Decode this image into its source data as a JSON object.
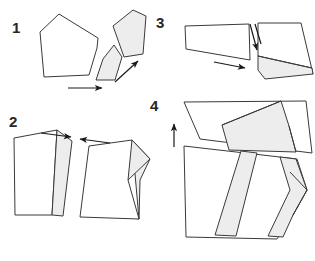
{
  "figure": {
    "width": 315,
    "height": 261,
    "background_color": "#ffffff",
    "outline_color": "#3a3a3a",
    "shaded_fill_color": "#ededed",
    "unshaded_fill_color": "#ffffff",
    "arrow_color": "#1a1a1a",
    "label_color": "#262626"
  },
  "panels": [
    {
      "id": "panel-1",
      "label": "1",
      "label_x": 12,
      "label_y": 33,
      "description": "Large unshaded pentagon at left with two shaded slivers split off to the right; horizontal arrow below and diagonal arrow pointing up-right",
      "shapes": [
        {
          "name": "main-pentagon",
          "shaded": false,
          "points": "59,14 98,38 97,48 89,75 44,77 40,32"
        },
        {
          "name": "shaded-sliver-lower",
          "shaded": true,
          "points": "114,45 122,57 115,80 96,80 103,59"
        },
        {
          "name": "shaded-sliver-upper",
          "shaded": true,
          "points": "133,10 146,16 143,54 124,57 113,26"
        }
      ],
      "arrows": [
        {
          "name": "arrow-right-bottom",
          "x1": 68,
          "y1": 88,
          "x2": 104,
          "y2": 88
        },
        {
          "name": "arrow-up-right",
          "x1": 115,
          "y1": 82,
          "x2": 140,
          "y2": 59
        }
      ]
    },
    {
      "id": "panel-2",
      "label": "2",
      "label_x": 9,
      "label_y": 127,
      "description": "Two polygons with shaded bands being pushed toward each other; arrow pointing right above the left shape and arrow pointing left above the right shape",
      "shapes": [
        {
          "name": "left-quad-unshaded",
          "shaded": false,
          "points": "14,138 57,130 52,215 15,215"
        },
        {
          "name": "left-band-shaded",
          "shaded": true,
          "points": "57,130 72,141 63,216 52,215"
        },
        {
          "name": "right-quad-unshaded",
          "shaded": false,
          "points": "89,146 132,140 139,219 80,217"
        },
        {
          "name": "right-band-shaded",
          "shaded": true,
          "points": "132,140 150,159 140,180 139,219 112,214 128,180"
        },
        {
          "name": "right-tip-shaded",
          "shaded": true,
          "points": "133,153 150,159 140,180"
        }
      ],
      "arrows": [
        {
          "name": "arrow-right-top-left-shape",
          "x1": 41,
          "y1": 133,
          "x2": 73,
          "y2": 137
        },
        {
          "name": "arrow-left-top-right-shape",
          "x1": 110,
          "y1": 143,
          "x2": 78,
          "y2": 139
        }
      ]
    },
    {
      "id": "panel-3",
      "label": "3",
      "label_x": 156,
      "label_y": 28,
      "description": "Left trapezoid separated from right trapezoid with a large shaded wedge; short double vertical arrow pointing down in the gap and a horizontal arrow pointing right below",
      "shapes": [
        {
          "name": "left-trapezoid",
          "shaded": false,
          "points": "185,26 249,24 250,60 186,49"
        },
        {
          "name": "right-trapezoid-unshaded",
          "shaded": false,
          "points": "258,23 301,23 312,68 258,56"
        },
        {
          "name": "right-wedge-shaded",
          "shaded": true,
          "points": "258,56 312,68 313,74 265,79"
        }
      ],
      "arrows": [
        {
          "name": "arrow-down-gap",
          "x1": 255,
          "y1": 24,
          "x2": 259,
          "y2": 52
        },
        {
          "name": "arrow-down-gap-second",
          "x1": 249,
          "y1": 24,
          "x2": 253,
          "y2": 52
        },
        {
          "name": "arrow-right-below",
          "x1": 214,
          "y1": 62,
          "x2": 247,
          "y2": 69
        }
      ]
    },
    {
      "id": "panel-4",
      "label": "4",
      "label_x": 150,
      "label_y": 111,
      "description": "Upper trapezoid with shaded band above a larger lower polygon containing shaded bands; vertical arrow pointing up at the left",
      "shapes": [
        {
          "name": "upper-trapezoid-unshaded",
          "shaded": false,
          "points": "184,102 281,101 281,117 200,139"
        },
        {
          "name": "upper-band-shaded",
          "shaded": true,
          "points": "281,101 289,126 296,152 229,150 222,125"
        },
        {
          "name": "upper-right-wing",
          "shaded": false,
          "points": "281,101 306,101 312,153 296,152 289,126"
        },
        {
          "name": "lower-main-unshaded",
          "shaded": false,
          "points": "184,146 297,159 307,190 293,215 277,239 186,237"
        },
        {
          "name": "lower-band-shaded-left",
          "shaded": true,
          "points": "241,151 257,153 236,236 215,235"
        },
        {
          "name": "lower-band-shaded-right",
          "shaded": true,
          "points": "280,157 296,159 307,190 293,215 283,236 268,235 290,190"
        },
        {
          "name": "lower-band-shaded-right-tip",
          "shaded": true,
          "points": "290,172 307,190 293,215"
        }
      ],
      "arrows": [
        {
          "name": "arrow-up-left",
          "x1": 174,
          "y1": 147,
          "x2": 174,
          "y2": 122
        }
      ]
    }
  ]
}
